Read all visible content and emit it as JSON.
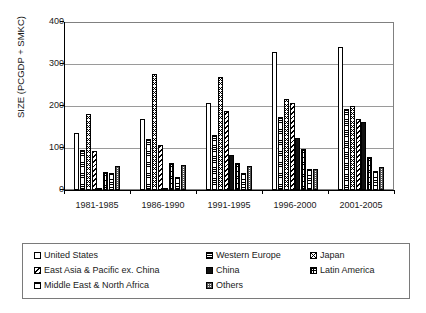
{
  "chart_data": {
    "type": "bar",
    "title": "",
    "xlabel": "",
    "ylabel": "SIZE (PCGDP + SMKC)",
    "ylim": [
      0,
      400
    ],
    "ytick_values": [
      0,
      100,
      200,
      300,
      400
    ],
    "ytick_labels": [
      "0",
      "100",
      "200",
      "300",
      "400"
    ],
    "grid": "horizontal",
    "legend_position": "bottom",
    "categories": [
      "1981-1985",
      "1986-1990",
      "1991-1995",
      "1996-2000",
      "2001-2005"
    ],
    "series": [
      {
        "name": "United States",
        "pattern": "blank",
        "values": [
          136,
          170,
          207,
          328,
          340
        ]
      },
      {
        "name": "Western Europe",
        "pattern": "hsmall",
        "values": [
          96,
          122,
          131,
          175,
          194
        ]
      },
      {
        "name": "Japan",
        "pattern": "diag-cross",
        "values": [
          180,
          276,
          269,
          216,
          199
        ]
      },
      {
        "name": "East Asia & Pacific ex. China",
        "pattern": "diag-wide",
        "values": [
          92,
          108,
          189,
          206,
          168
        ]
      },
      {
        "name": "China",
        "pattern": "solid",
        "values": [
          3,
          3,
          83,
          124,
          163
        ]
      },
      {
        "name": "Latin America",
        "pattern": "grid-small",
        "values": [
          42,
          64,
          64,
          98,
          78
        ]
      },
      {
        "name": "Middle East & North Africa",
        "pattern": "hmed",
        "values": [
          40,
          32,
          40,
          50,
          46
        ]
      },
      {
        "name": "Others",
        "pattern": "grid-dot",
        "values": [
          57,
          60,
          56,
          50,
          54
        ]
      }
    ]
  },
  "axis": {
    "y_title": "SIZE (PCGDP + SMKC)",
    "y_labels": [
      "400",
      "300",
      "200",
      "100",
      "0"
    ],
    "x_labels": [
      "1981-1985",
      "1986-1990",
      "1991-1995",
      "1996-2000",
      "2001-2005"
    ]
  },
  "legend": {
    "rows": [
      [
        {
          "label": "United States",
          "pattern": "blank"
        },
        {
          "label": "Western Europe",
          "pattern": "hsmall"
        },
        {
          "label": "Japan",
          "pattern": "diag-cross"
        }
      ],
      [
        {
          "label": "East Asia & Pacific ex. China",
          "pattern": "diag-wide"
        },
        {
          "label": "China",
          "pattern": "solid"
        },
        {
          "label": "Latin America",
          "pattern": "grid-small"
        }
      ],
      [
        {
          "label": "Middle East & North Africa",
          "pattern": "hmed"
        },
        {
          "label": "Others",
          "pattern": "grid-dot"
        }
      ]
    ]
  },
  "colors": {
    "background": "#ffffff",
    "axis": "#000000",
    "gridline": "#9a9a9a",
    "bar_outline": "#000000",
    "china_fill": "#111111",
    "text": "#1a1a1a"
  }
}
